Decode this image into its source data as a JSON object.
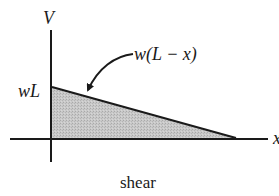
{
  "diagram": {
    "caption": "shear",
    "axes": {
      "y_label": "V",
      "x_label": "x"
    },
    "labels": {
      "intercept": "wL",
      "curve": "w(L − x)"
    },
    "shape": {
      "type": "triangle",
      "fill": "#c6c6c6",
      "stroke": "#1a1a1a",
      "points": [
        [
          52,
          87
        ],
        [
          236,
          138
        ],
        [
          52,
          138
        ]
      ]
    },
    "colors": {
      "ink": "#1a1a1a",
      "fill": "#c6c6c6",
      "background": "#ffffff"
    }
  }
}
